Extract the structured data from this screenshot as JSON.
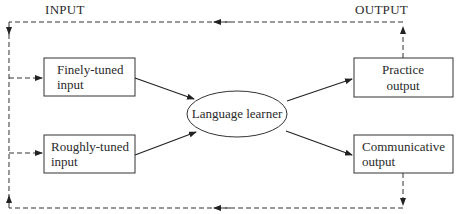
{
  "headers": {
    "input": "INPUT",
    "output": "OUTPUT"
  },
  "nodes": {
    "finely_tuned": [
      "Finely-tuned",
      "input"
    ],
    "roughly_tuned": [
      "Roughly-tuned",
      "input"
    ],
    "learner": "Language learner",
    "practice": [
      "Practice",
      "output"
    ],
    "communicative": [
      "Communicative",
      "output"
    ]
  },
  "edges": [
    {
      "from": "finely_tuned",
      "to": "learner",
      "style": "solid"
    },
    {
      "from": "roughly_tuned",
      "to": "learner",
      "style": "solid"
    },
    {
      "from": "learner",
      "to": "practice",
      "style": "solid"
    },
    {
      "from": "learner",
      "to": "communicative",
      "style": "solid"
    },
    {
      "from": "practice",
      "to": "finely_tuned",
      "style": "dashed",
      "via": "top feedback loop"
    },
    {
      "from": "communicative",
      "to": "roughly_tuned",
      "style": "dashed",
      "via": "bottom feedback loop"
    }
  ]
}
